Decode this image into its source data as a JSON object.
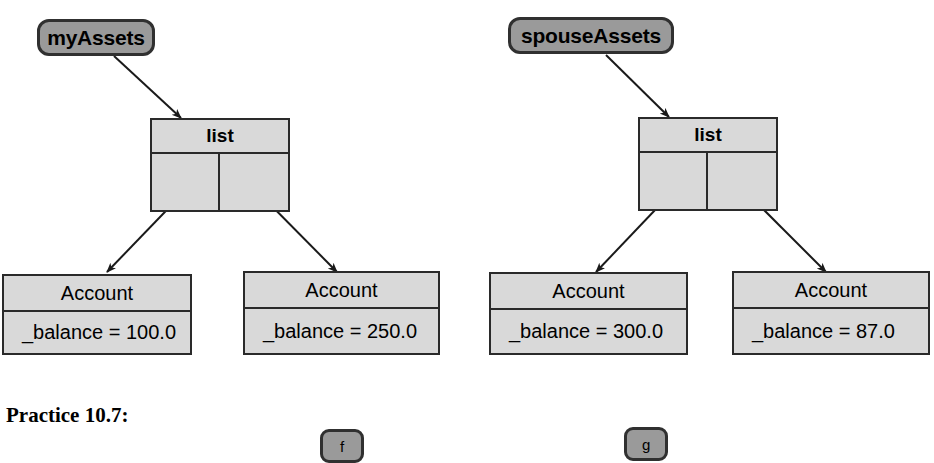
{
  "figure": {
    "background_color": "#ffffff",
    "box_fill": "#d9d9d9",
    "var_fill": "#9a9a9a",
    "line_color": "#2a2a2a"
  },
  "variables": [
    {
      "id": "myAssets",
      "label": "myAssets"
    },
    {
      "id": "spouseAssets",
      "label": "spouseAssets"
    }
  ],
  "lists": [
    {
      "id": "list-left",
      "title": "list",
      "cells": 2
    },
    {
      "id": "list-right",
      "title": "list",
      "cells": 2
    }
  ],
  "accounts": [
    {
      "id": "account-1",
      "class_name": "Account",
      "field": "_balance = 100.0"
    },
    {
      "id": "account-2",
      "class_name": "Account",
      "field": "_balance = 250.0"
    },
    {
      "id": "account-3",
      "class_name": "Account",
      "field": "_balance = 300.0"
    },
    {
      "id": "account-4",
      "class_name": "Account",
      "field": "_balance = 87.0"
    }
  ],
  "caption": {
    "text": "Practice 10.7:"
  },
  "small_variables": [
    {
      "id": "f-box",
      "label": "f"
    },
    {
      "id": "g-box",
      "label": "g"
    }
  ]
}
